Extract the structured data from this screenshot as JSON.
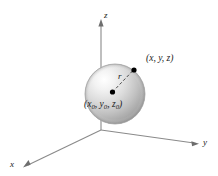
{
  "figure": {
    "kind": "3d-sphere-diagram",
    "background_color": "#ffffff",
    "axes": {
      "z_label": "z",
      "y_label": "y",
      "x_label": "x",
      "line_color": "#8a8a8a",
      "arrow_color": "#6e6e6e"
    },
    "sphere": {
      "fill_light": "#fdfdfd",
      "fill_mid": "#d8d8d8",
      "fill_dark": "#9a9a9a",
      "outline_color": "#9e9e9e",
      "center_x": 115,
      "center_y": 94,
      "radius": 30
    },
    "center_point": {
      "label_open": "(",
      "var_x": "x",
      "sub_x": "0",
      "sep1": ", ",
      "var_y": "y",
      "sub_y": "0",
      "sep2": ", ",
      "var_z": "z",
      "sub_z": "0",
      "label_close": ")",
      "dot_color": "#000000"
    },
    "surface_point": {
      "label": "(x, y, z)",
      "dot_color": "#000000"
    },
    "radius": {
      "label": "r",
      "style": "dashed",
      "color": "#4a4a4a"
    }
  }
}
